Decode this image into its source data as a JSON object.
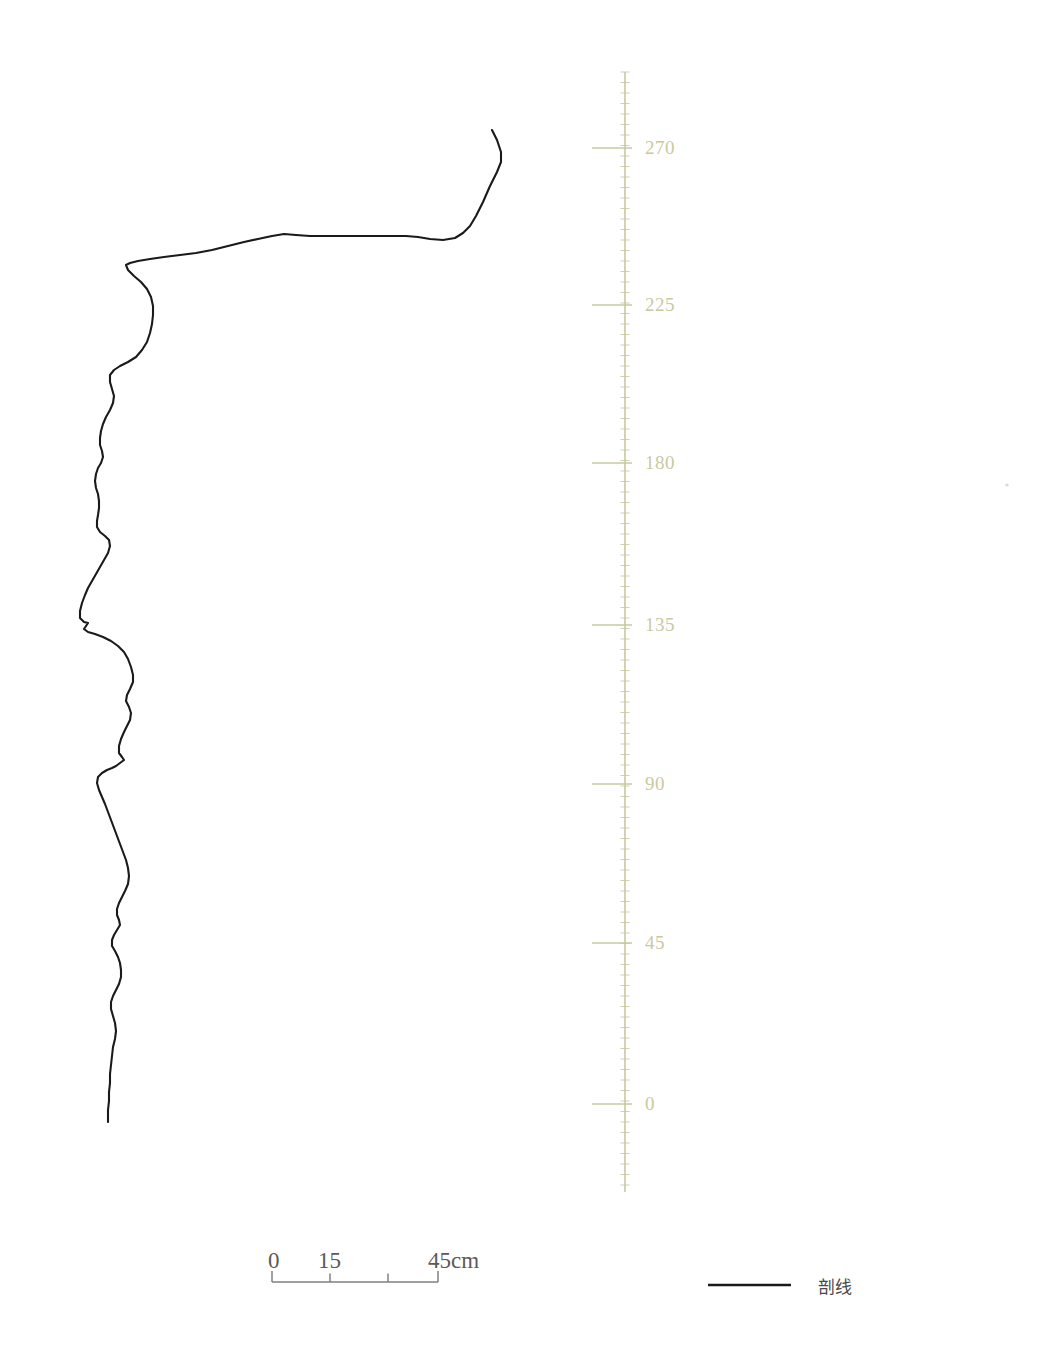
{
  "figure": {
    "type": "profile-section-drawing",
    "background_color": "#ffffff",
    "profile_line_color": "#1a1a1a",
    "axis_color": "#c9c9a0",
    "scalebar_color": "#808080"
  },
  "vertical_axis": {
    "name": "depth-scale",
    "color": "#c9c9a0",
    "x": 625,
    "y_top": 72,
    "y_bottom": 1192,
    "minor_tick_spacing": 10.5,
    "major_ticks": [
      {
        "label": "270",
        "y": 148
      },
      {
        "label": "225",
        "y": 305
      },
      {
        "label": "180",
        "y": 463
      },
      {
        "label": "135",
        "y": 625
      },
      {
        "label": "90",
        "y": 784
      },
      {
        "label": "45",
        "y": 943
      },
      {
        "label": "0",
        "y": 1104
      }
    ],
    "label_x": 645,
    "tick_left_x": 592,
    "tick_right_x": 632
  },
  "scalebar": {
    "name": "horizontal-scale-bar",
    "color": "#808080",
    "x_start": 272,
    "x_end": 438,
    "y": 1282,
    "cap_height": 11,
    "ticks": [
      {
        "label": "0",
        "x": 272
      },
      {
        "label": "15",
        "x": 330
      },
      {
        "label": "",
        "x": 388
      },
      {
        "label": "45cm",
        "x": 438
      }
    ],
    "labels": [
      {
        "text": "0",
        "x": 268,
        "y": 1248
      },
      {
        "text": "15",
        "x": 318,
        "y": 1248
      },
      {
        "text": "45cm",
        "x": 428,
        "y": 1248
      }
    ]
  },
  "legend": {
    "name": "legend",
    "items": [
      {
        "label": "剖线",
        "swatch_type": "line",
        "color": "#1a1a1a",
        "line_x_start": 708,
        "line_x_end": 791,
        "line_y": 1285,
        "label_x": 818
      }
    ]
  },
  "chart_data": {
    "type": "line",
    "title": "",
    "xlabel": "",
    "ylabel": "",
    "legend": [
      "剖线"
    ],
    "grid": false,
    "axis_units": "cm",
    "y_tick_values": [
      0,
      45,
      90,
      135,
      180,
      225,
      270
    ],
    "scalebar_tick_values": [
      0,
      15,
      30,
      45
    ],
    "scalebar_unit": "cm",
    "series": [
      {
        "name": "剖线",
        "color": "#1a1a1a",
        "points": [
          [
            492,
            130
          ],
          [
            497,
            140
          ],
          [
            501,
            152
          ],
          [
            501,
            162
          ],
          [
            497,
            172
          ],
          [
            490,
            186
          ],
          [
            483,
            202
          ],
          [
            476,
            216
          ],
          [
            470,
            226
          ],
          [
            463,
            233
          ],
          [
            455,
            238
          ],
          [
            443,
            240
          ],
          [
            430,
            239
          ],
          [
            418,
            237
          ],
          [
            406,
            236
          ],
          [
            392,
            236
          ],
          [
            378,
            236
          ],
          [
            362,
            236
          ],
          [
            344,
            236
          ],
          [
            326,
            236
          ],
          [
            310,
            236
          ],
          [
            296,
            235
          ],
          [
            284,
            234
          ],
          [
            272,
            236
          ],
          [
            258,
            239
          ],
          [
            244,
            242
          ],
          [
            228,
            246
          ],
          [
            212,
            250
          ],
          [
            196,
            253
          ],
          [
            180,
            255
          ],
          [
            164,
            257
          ],
          [
            150,
            259
          ],
          [
            138,
            261
          ],
          [
            130,
            263
          ],
          [
            126,
            265
          ],
          [
            128,
            270
          ],
          [
            134,
            276
          ],
          [
            141,
            282
          ],
          [
            147,
            289
          ],
          [
            151,
            297
          ],
          [
            153,
            306
          ],
          [
            153,
            315
          ],
          [
            152,
            324
          ],
          [
            150,
            333
          ],
          [
            147,
            342
          ],
          [
            142,
            350
          ],
          [
            136,
            357
          ],
          [
            128,
            362
          ],
          [
            120,
            366
          ],
          [
            114,
            370
          ],
          [
            110,
            375
          ],
          [
            110,
            382
          ],
          [
            112,
            389
          ],
          [
            114,
            396
          ],
          [
            113,
            403
          ],
          [
            110,
            410
          ],
          [
            106,
            417
          ],
          [
            103,
            424
          ],
          [
            101,
            431
          ],
          [
            100,
            438
          ],
          [
            100,
            445
          ],
          [
            102,
            451
          ],
          [
            103,
            457
          ],
          [
            101,
            463
          ],
          [
            98,
            468
          ],
          [
            96,
            474
          ],
          [
            95,
            481
          ],
          [
            96,
            488
          ],
          [
            98,
            494
          ],
          [
            99,
            501
          ],
          [
            99,
            508
          ],
          [
            98,
            515
          ],
          [
            97,
            521
          ],
          [
            97,
            527
          ],
          [
            100,
            532
          ],
          [
            105,
            536
          ],
          [
            109,
            540
          ],
          [
            110,
            546
          ],
          [
            108,
            553
          ],
          [
            104,
            560
          ],
          [
            100,
            567
          ],
          [
            96,
            574
          ],
          [
            92,
            581
          ],
          [
            88,
            588
          ],
          [
            85,
            595
          ],
          [
            82,
            603
          ],
          [
            80,
            611
          ],
          [
            80,
            618
          ],
          [
            84,
            622
          ],
          [
            88,
            623
          ],
          [
            86,
            626
          ],
          [
            84,
            629
          ],
          [
            88,
            632
          ],
          [
            95,
            634
          ],
          [
            103,
            637
          ],
          [
            111,
            641
          ],
          [
            118,
            646
          ],
          [
            124,
            652
          ],
          [
            128,
            659
          ],
          [
            131,
            667
          ],
          [
            133,
            675
          ],
          [
            133,
            682
          ],
          [
            130,
            689
          ],
          [
            127,
            695
          ],
          [
            126,
            701
          ],
          [
            129,
            707
          ],
          [
            131,
            713
          ],
          [
            130,
            720
          ],
          [
            127,
            726
          ],
          [
            124,
            732
          ],
          [
            121,
            739
          ],
          [
            119,
            746
          ],
          [
            119,
            753
          ],
          [
            122,
            757
          ],
          [
            124,
            760
          ],
          [
            120,
            763
          ],
          [
            116,
            766
          ],
          [
            112,
            768
          ],
          [
            107,
            770
          ],
          [
            102,
            773
          ],
          [
            98,
            777
          ],
          [
            97,
            783
          ],
          [
            99,
            790
          ],
          [
            102,
            797
          ],
          [
            105,
            804
          ],
          [
            108,
            812
          ],
          [
            111,
            820
          ],
          [
            114,
            828
          ],
          [
            117,
            836
          ],
          [
            120,
            844
          ],
          [
            123,
            852
          ],
          [
            126,
            860
          ],
          [
            128,
            868
          ],
          [
            129,
            876
          ],
          [
            128,
            884
          ],
          [
            125,
            891
          ],
          [
            122,
            897
          ],
          [
            119,
            903
          ],
          [
            117,
            909
          ],
          [
            117,
            915
          ],
          [
            119,
            920
          ],
          [
            120,
            925
          ],
          [
            117,
            930
          ],
          [
            114,
            935
          ],
          [
            112,
            940
          ],
          [
            112,
            946
          ],
          [
            115,
            951
          ],
          [
            118,
            957
          ],
          [
            120,
            963
          ],
          [
            121,
            970
          ],
          [
            121,
            977
          ],
          [
            119,
            984
          ],
          [
            116,
            990
          ],
          [
            113,
            996
          ],
          [
            111,
            1002
          ],
          [
            111,
            1009
          ],
          [
            113,
            1016
          ],
          [
            115,
            1023
          ],
          [
            116,
            1031
          ],
          [
            115,
            1039
          ],
          [
            113,
            1047
          ],
          [
            112,
            1056
          ],
          [
            111,
            1065
          ],
          [
            110,
            1074
          ],
          [
            110,
            1083
          ],
          [
            109,
            1092
          ],
          [
            109,
            1101
          ],
          [
            108,
            1110
          ],
          [
            108,
            1122
          ]
        ]
      }
    ]
  },
  "marks": [
    {
      "name": "faint-mark",
      "x": 1007,
      "y": 485,
      "color": "#b8b8b8"
    }
  ]
}
